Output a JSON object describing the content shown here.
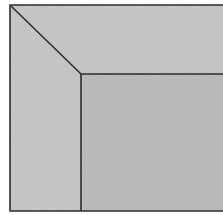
{
  "diagram": {
    "colors": {
      "background": "#ffffff",
      "outer_fill": "#c8c8c8",
      "inner_fill": "#bdbdbd",
      "stroke": "#2e2e2e"
    },
    "outer_frame": {
      "x": 10,
      "y": 5,
      "right": 223,
      "bottom": 211
    },
    "inner_panel": {
      "x": 81,
      "y": 74,
      "right": 223,
      "bottom": 211
    },
    "miter_line": {
      "x1": 11,
      "y1": 6,
      "x2": 81,
      "y2": 74
    }
  }
}
